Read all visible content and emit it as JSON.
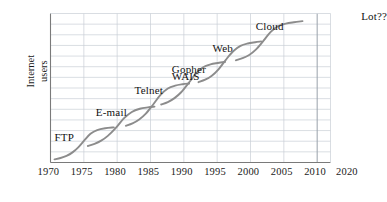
{
  "chart_data": {
    "type": "line",
    "title": "",
    "subtitle": "",
    "xlabel": "",
    "ylabel": "Internet\nusers",
    "xlim": [
      1970,
      2012
    ],
    "ylim": [
      0,
      14
    ],
    "grid": true,
    "legend_position": "none",
    "x_ticks": [
      1970,
      1975,
      1980,
      1985,
      1990,
      1995,
      2000,
      2005,
      2010
    ],
    "x_tick_labels": [
      "1970",
      "1975",
      "1980",
      "1985",
      "1990",
      "1995",
      "2000",
      "2005",
      "2010"
    ],
    "y_ticks": [
      0,
      1,
      2,
      3,
      4,
      5,
      6,
      7,
      8,
      9,
      10,
      11,
      12,
      13
    ],
    "y_tick_labels": [],
    "x_gridline_step_years": 5,
    "y_gridline_count": 13,
    "extra_axis_label": "2020",
    "future_annotation": "Lot??",
    "annotations": [
      {
        "text": "FTP",
        "x": 1973.0,
        "y": 2.2
      },
      {
        "text": "E-mail",
        "x": 1979.2,
        "y": 4.6
      },
      {
        "text": "Telnet",
        "x": 1985.0,
        "y": 6.6
      },
      {
        "text": "Gopher",
        "x": 1990.6,
        "y": 8.6
      },
      {
        "text": "WAIS",
        "x": 1990.6,
        "y": 7.9
      },
      {
        "text": "Web",
        "x": 1996.7,
        "y": 10.6
      },
      {
        "text": "Cloud",
        "x": 2003.2,
        "y": 12.6
      },
      {
        "text": "Lot??",
        "x": 2019.0,
        "y": 13.6
      }
    ],
    "series": [
      {
        "name": "FTP",
        "color": "#8c8c8c",
        "points": [
          {
            "x": 1970.6,
            "y": 0.3
          },
          {
            "x": 1971.5,
            "y": 0.42
          },
          {
            "x": 1972.4,
            "y": 0.62
          },
          {
            "x": 1973.3,
            "y": 0.95
          },
          {
            "x": 1974.2,
            "y": 1.45
          },
          {
            "x": 1975.1,
            "y": 2.1
          },
          {
            "x": 1976.0,
            "y": 2.7
          },
          {
            "x": 1977.0,
            "y": 3.05
          },
          {
            "x": 1978.2,
            "y": 3.22
          },
          {
            "x": 1979.5,
            "y": 3.3
          }
        ]
      },
      {
        "name": "E-mail",
        "color": "#8c8c8c",
        "points": [
          {
            "x": 1975.6,
            "y": 1.55
          },
          {
            "x": 1976.6,
            "y": 1.75
          },
          {
            "x": 1977.6,
            "y": 2.05
          },
          {
            "x": 1978.6,
            "y": 2.5
          },
          {
            "x": 1979.8,
            "y": 3.25
          },
          {
            "x": 1981.0,
            "y": 4.15
          },
          {
            "x": 1982.2,
            "y": 4.75
          },
          {
            "x": 1983.4,
            "y": 5.05
          },
          {
            "x": 1984.6,
            "y": 5.18
          },
          {
            "x": 1985.6,
            "y": 5.25
          }
        ]
      },
      {
        "name": "Telnet",
        "color": "#8c8c8c",
        "points": [
          {
            "x": 1981.3,
            "y": 3.45
          },
          {
            "x": 1982.3,
            "y": 3.68
          },
          {
            "x": 1983.3,
            "y": 4.05
          },
          {
            "x": 1984.3,
            "y": 4.6
          },
          {
            "x": 1985.4,
            "y": 5.45
          },
          {
            "x": 1986.5,
            "y": 6.35
          },
          {
            "x": 1987.6,
            "y": 6.95
          },
          {
            "x": 1988.7,
            "y": 7.22
          },
          {
            "x": 1989.8,
            "y": 7.35
          },
          {
            "x": 1990.8,
            "y": 7.42
          }
        ]
      },
      {
        "name": "Gopher/WAIS",
        "color": "#8c8c8c",
        "points": [
          {
            "x": 1986.6,
            "y": 5.45
          },
          {
            "x": 1987.6,
            "y": 5.68
          },
          {
            "x": 1988.6,
            "y": 6.05
          },
          {
            "x": 1989.6,
            "y": 6.6
          },
          {
            "x": 1990.7,
            "y": 7.45
          },
          {
            "x": 1991.8,
            "y": 8.35
          },
          {
            "x": 1992.9,
            "y": 8.95
          },
          {
            "x": 1994.0,
            "y": 9.22
          },
          {
            "x": 1995.1,
            "y": 9.35
          },
          {
            "x": 1996.2,
            "y": 9.45
          }
        ]
      },
      {
        "name": "Web",
        "color": "#8c8c8c",
        "points": [
          {
            "x": 1992.2,
            "y": 7.55
          },
          {
            "x": 1993.2,
            "y": 7.78
          },
          {
            "x": 1994.2,
            "y": 8.15
          },
          {
            "x": 1995.2,
            "y": 8.75
          },
          {
            "x": 1996.3,
            "y": 9.65
          },
          {
            "x": 1997.4,
            "y": 10.45
          },
          {
            "x": 1998.5,
            "y": 10.95
          },
          {
            "x": 1999.6,
            "y": 11.18
          },
          {
            "x": 2000.7,
            "y": 11.3
          },
          {
            "x": 2001.6,
            "y": 11.38
          }
        ]
      },
      {
        "name": "Cloud",
        "color": "#8c8c8c",
        "points": [
          {
            "x": 1997.8,
            "y": 9.6
          },
          {
            "x": 1998.8,
            "y": 9.8
          },
          {
            "x": 1999.8,
            "y": 10.1
          },
          {
            "x": 2000.8,
            "y": 10.6
          },
          {
            "x": 2001.9,
            "y": 11.4
          },
          {
            "x": 2003.0,
            "y": 12.25
          },
          {
            "x": 2004.1,
            "y": 12.8
          },
          {
            "x": 2005.3,
            "y": 13.05
          },
          {
            "x": 2006.5,
            "y": 13.18
          },
          {
            "x": 2007.8,
            "y": 13.28
          }
        ]
      }
    ],
    "colors": {
      "curve": "#8c8c8c",
      "grid": "#c9cfd6",
      "axis": "#7a7a7a",
      "emphasis_gridline": "#9aa2ab",
      "text": "#1a1a1a",
      "background": "#ffffff"
    }
  }
}
